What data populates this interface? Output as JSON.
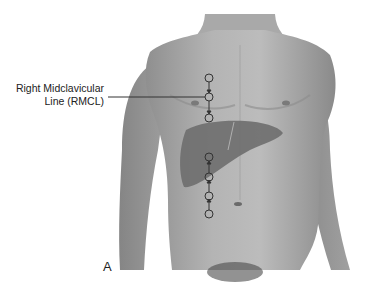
{
  "figure": {
    "panel_letter": "A",
    "label": {
      "line1": "Right Midclavicular",
      "line2": "Line (RMCL)"
    },
    "colors": {
      "background": "#ffffff",
      "skin_light": "#b5b5b5",
      "skin_mid": "#9a9a9a",
      "skin_dark": "#7a7a7a",
      "liver": "#6e6e6e",
      "marker_stroke": "#333333"
    },
    "markers": {
      "upper": [
        78,
        97,
        118
      ],
      "lower": [
        157,
        177,
        196,
        214
      ],
      "x": 209
    }
  }
}
